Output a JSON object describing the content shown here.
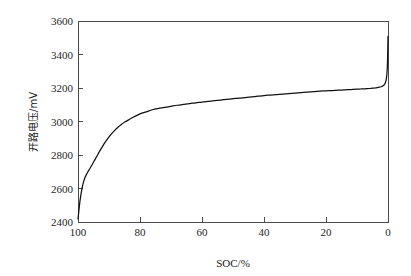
{
  "figure": {
    "name": "ocv-soc-curve-figure",
    "background_color": "#fefefe",
    "line_color": "#111111",
    "axis_color": "#4a4a4a"
  },
  "chart_data": {
    "type": "line",
    "title": "",
    "subtitle": "",
    "xlabel": "SOC/%",
    "ylabel": "开路电压/mV",
    "xlim": [
      100,
      0
    ],
    "ylim": [
      2400,
      3600
    ],
    "x_inverted": true,
    "grid": false,
    "legend": null,
    "legend_position": "none",
    "xticks": [
      100,
      80,
      60,
      40,
      20,
      0
    ],
    "xtick_labels": [
      "100",
      "80",
      "60",
      "40",
      "20",
      "0"
    ],
    "yticks": [
      2400,
      2600,
      2800,
      3000,
      3200,
      3400,
      3600
    ],
    "ytick_labels": [
      "2400",
      "2600",
      "2800",
      "3000",
      "3200",
      "3400",
      "3600"
    ],
    "series": [
      {
        "name": "开路电压",
        "color": "#111111",
        "x": [
          100.0,
          99.7,
          99.4,
          99.0,
          98.6,
          98.2,
          97.8,
          97.3,
          96.8,
          96.2,
          95.5,
          94.8,
          94.0,
          93.2,
          92.3,
          91.4,
          90.4,
          89.4,
          88.3,
          87.2,
          86.0,
          84.8,
          83.5,
          82.2,
          80.8,
          79.4,
          78.0,
          76.0,
          74.0,
          72.0,
          70.0,
          68.0,
          66.0,
          64.0,
          62.0,
          60.0,
          58.0,
          56.0,
          54.0,
          52.0,
          50.0,
          48.0,
          46.0,
          44.0,
          42.0,
          40.0,
          38.0,
          36.0,
          34.0,
          32.0,
          30.0,
          28.0,
          26.0,
          24.0,
          22.0,
          20.0,
          18.0,
          16.0,
          14.0,
          12.0,
          10.0,
          9.0,
          8.0,
          7.0,
          6.0,
          5.0,
          4.2,
          3.5,
          3.0,
          2.5,
          2.0,
          1.6,
          1.3,
          1.0,
          0.8,
          0.6,
          0.45,
          0.32,
          0.22,
          0.14,
          0.08,
          0.04,
          0.0
        ],
        "y": [
          2418,
          2470,
          2520,
          2570,
          2610,
          2640,
          2663,
          2683,
          2700,
          2718,
          2740,
          2764,
          2790,
          2817,
          2845,
          2872,
          2898,
          2922,
          2944,
          2964,
          2982,
          2998,
          3012,
          3025,
          3038,
          3050,
          3058,
          3070,
          3078,
          3085,
          3091,
          3097,
          3102,
          3107,
          3111,
          3116,
          3120,
          3124,
          3128,
          3132,
          3136,
          3140,
          3143,
          3147,
          3151,
          3155,
          3158,
          3161,
          3164,
          3167,
          3170,
          3173,
          3176,
          3178,
          3181,
          3183,
          3185,
          3187,
          3189,
          3191,
          3193,
          3194,
          3195,
          3196,
          3197,
          3199,
          3200,
          3202,
          3204,
          3206,
          3209,
          3213,
          3218,
          3225,
          3234,
          3248,
          3266,
          3292,
          3325,
          3368,
          3420,
          3470,
          3508
        ]
      }
    ]
  }
}
